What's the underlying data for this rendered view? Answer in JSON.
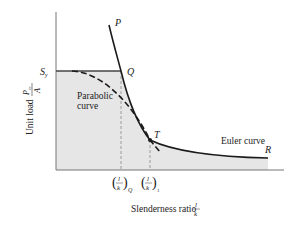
{
  "diagram": {
    "type": "column buckling design curves",
    "axes": {
      "y_label_text": "Unit load",
      "y_label_fraction": {
        "numerator": "P",
        "numerator_sub": "cr",
        "denominator": "A"
      },
      "x_label_text": "Slenderness ratio",
      "x_label_fraction": {
        "numerator": "l",
        "denominator": "k"
      }
    },
    "points": {
      "S_y": {
        "label": "S",
        "sub": "y"
      },
      "P": {
        "label": "P"
      },
      "Q": {
        "label": "Q"
      },
      "T": {
        "label": "T"
      },
      "R": {
        "label": "R"
      }
    },
    "curves": {
      "parabolic": {
        "line1": "Parabolic",
        "line2": "curve"
      },
      "euler": {
        "label": "Euler curve"
      }
    },
    "tick_labels": {
      "q": {
        "numerator": "l",
        "denominator": "k",
        "sub": "Q"
      },
      "one": {
        "numerator": "l",
        "denominator": "k",
        "sub": "1"
      }
    },
    "colors": {
      "shade": "#e6e6e6",
      "line": "#1a1a1a",
      "axis": "#777777",
      "dash": "#888888"
    }
  }
}
